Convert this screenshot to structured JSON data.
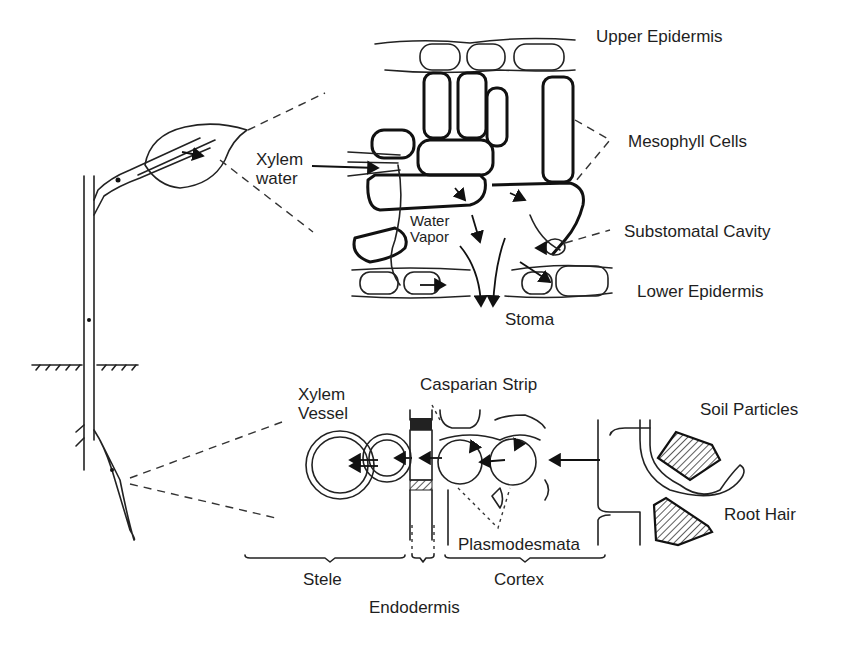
{
  "diagram": {
    "leaf_section": {
      "labels": {
        "xylem_water": [
          "Xylem",
          "water"
        ],
        "upper_epidermis": "Upper Epidermis",
        "mesophyll_cells": "Mesophyll Cells",
        "water_vapor": [
          "Water",
          "Vapor"
        ],
        "substomatal_cavity": "Substomatal Cavity",
        "lower_epidermis": "Lower Epidermis",
        "stoma": "Stoma"
      }
    },
    "root_section": {
      "labels": {
        "xylem_vessel": [
          "Xylem",
          "Vessel"
        ],
        "casparian_strip": "Casparian Strip",
        "soil_particles": "Soil Particles",
        "root_hair": "Root Hair",
        "plasmodesmata": "Plasmodesmata",
        "stele": "Stele",
        "endodermis": "Endodermis",
        "cortex": "Cortex"
      }
    },
    "colors": {
      "line": "#222222",
      "background": "#ffffff",
      "hatch": "#333333"
    }
  }
}
